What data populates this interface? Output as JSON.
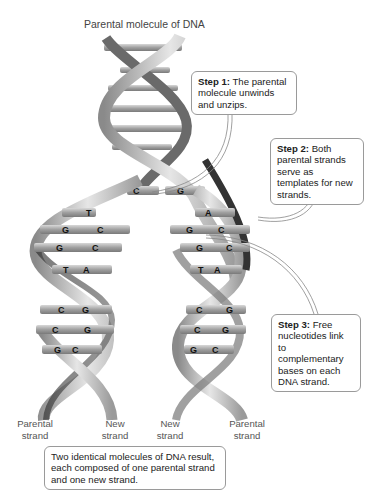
{
  "title": "Parental molecule of DNA",
  "callouts": {
    "step1": {
      "heading": "Step 1:",
      "text": " The parental molecule unwinds and unzips."
    },
    "step2": {
      "heading": "Step 2:",
      "text": " Both parental strands serve as templates for new strands."
    },
    "step3": {
      "heading": "Step 3:",
      "text": " Free nucleotides link to complementary bases on each DNA strand."
    },
    "result": {
      "text": "Two identical molecules of DNA result, each composed of one parental strand and one new strand."
    }
  },
  "strand_labels": [
    {
      "line1": "Parental",
      "line2": "strand"
    },
    {
      "line1": "New",
      "line2": "strand"
    },
    {
      "line1": "New",
      "line2": "strand"
    },
    {
      "line1": "Parental",
      "line2": "strand"
    }
  ],
  "bases": {
    "fork_left": "C",
    "fork_right": "G",
    "left_helix": [
      [
        "T",
        ""
      ],
      [
        "G",
        "C"
      ],
      [
        "G",
        "C"
      ],
      [
        "T",
        "A"
      ],
      [
        "C",
        "G"
      ],
      [
        "C",
        "G"
      ],
      [
        "G",
        "C"
      ]
    ],
    "right_helix": [
      [
        "",
        "A"
      ],
      [
        "G",
        "C"
      ],
      [
        "G",
        "C"
      ],
      [
        "T",
        "A"
      ],
      [
        "C",
        "G"
      ],
      [
        "C",
        "G"
      ],
      [
        "G",
        "C"
      ]
    ]
  },
  "colors": {
    "strand_light": "#c8c8c8",
    "strand_dark": "#3a3a3a",
    "base_bar": "#a8a8a8",
    "callout_border": "#9a9a9a"
  }
}
